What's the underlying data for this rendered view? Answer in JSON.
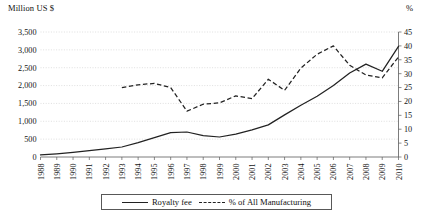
{
  "chart_data": {
    "type": "line",
    "title": "",
    "xlabel": "",
    "ylabel": "Million US $",
    "y2label": "%",
    "grid": true,
    "legend_position": "bottom",
    "categories": [
      1988,
      1989,
      1990,
      1991,
      1992,
      1993,
      1994,
      1995,
      1996,
      1997,
      1998,
      1999,
      2000,
      2001,
      2002,
      2003,
      2004,
      2005,
      2006,
      2007,
      2008,
      2009,
      2010
    ],
    "ylim": [
      0,
      3500
    ],
    "yticks": [
      0,
      500,
      1000,
      1500,
      2000,
      2500,
      3000,
      3500
    ],
    "ytick_labels": [
      "0",
      "500",
      "1,000",
      "1,500",
      "2,000",
      "2,500",
      "3,000",
      "3,500"
    ],
    "y2lim": [
      0,
      45
    ],
    "y2ticks": [
      0,
      5,
      10,
      15,
      20,
      25,
      30,
      35,
      40,
      45
    ],
    "y2tick_labels": [
      "0",
      "5",
      "10",
      "15",
      "20",
      "25",
      "30",
      "35",
      "40",
      "45"
    ],
    "xtick_labels": [
      "1988",
      "1989",
      "1990",
      "1991",
      "1992",
      "1993",
      "1994",
      "1995",
      "1996",
      "1997",
      "1998",
      "1999",
      "2000",
      "2001",
      "2002",
      "2003",
      "2004",
      "2005",
      "2006",
      "2007",
      "2008",
      "2009",
      "2010"
    ],
    "series": [
      {
        "name": "Royalty fee",
        "axis": "left",
        "style": "solid",
        "units": "Million US $",
        "x": [
          1988,
          1989,
          1990,
          1991,
          1992,
          1993,
          1994,
          1995,
          1996,
          1997,
          1998,
          1999,
          2000,
          2001,
          2002,
          2003,
          2004,
          2005,
          2006,
          2007,
          2008,
          2009,
          2010
        ],
        "values": [
          60,
          90,
          130,
          180,
          230,
          280,
          400,
          540,
          680,
          700,
          600,
          560,
          640,
          760,
          900,
          1180,
          1450,
          1700,
          2000,
          2350,
          2600,
          2400,
          3100
        ]
      },
      {
        "name": "% of All Manufacturing",
        "axis": "right",
        "style": "dashed",
        "units": "%",
        "x": [
          1993,
          1994,
          1995,
          1996,
          1997,
          1998,
          1999,
          2000,
          2001,
          2002,
          2003,
          2004,
          2005,
          2006,
          2007,
          2008,
          2009,
          2010
        ],
        "values": [
          25,
          26,
          26.5,
          25,
          16.5,
          19,
          19.5,
          22,
          21,
          28,
          24,
          32,
          37,
          40,
          33,
          29.5,
          28.5,
          36
        ]
      }
    ]
  },
  "labels": {
    "y_left_title": "Million US $",
    "y_right_title": "%"
  },
  "legend": {
    "items": [
      {
        "label": "Royalty fee",
        "style": "solid"
      },
      {
        "label": "% of All Manufacturing",
        "style": "dashed"
      }
    ]
  }
}
